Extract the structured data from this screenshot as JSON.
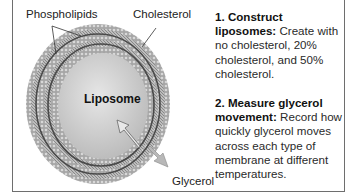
{
  "diagram": {
    "labels": {
      "phospholipids": "Phospholipids",
      "cholesterol": "Cholesterol",
      "liposome": "Liposome",
      "glycerol": "Glycerol"
    },
    "steps": [
      {
        "title": "1. Construct liposomes:",
        "body": "Create with no cholesterol, 20% cholesterol, and 50% cholesterol."
      },
      {
        "title": "2. Measure glycerol movement:",
        "body": "Record how quickly glycerol moves across each type of membrane at different temperatures."
      }
    ],
    "colors": {
      "membrane": "#9a9a9a",
      "membrane_dark": "#4a4a4a",
      "core": "#d4d4d4",
      "arrow": "#b8b8b8",
      "border": "#6e6e6e"
    }
  }
}
